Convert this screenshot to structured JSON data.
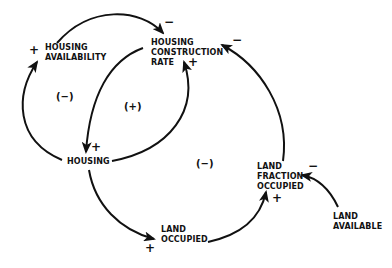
{
  "diagram": {
    "type": "causal-loop",
    "nodes": [
      {
        "id": "housing_availability",
        "label": "HOUSING\nAVAILABILITY"
      },
      {
        "id": "housing_construction_rate",
        "label": "HOUSING\nCONSTRUCTION\nRATE"
      },
      {
        "id": "housing",
        "label": "HOUSING"
      },
      {
        "id": "land_occupied",
        "label": "LAND\nOCCUPIED"
      },
      {
        "id": "land_fraction_occupied",
        "label": "LAND\nFRACTION\nOCCUPIED"
      },
      {
        "id": "land_available",
        "label": "LAND\nAVAILABLE"
      }
    ],
    "edges": [
      {
        "from": "housing_availability",
        "to": "housing_construction_rate",
        "sign": "−"
      },
      {
        "from": "housing",
        "to": "housing_construction_rate",
        "sign": "+"
      },
      {
        "from": "housing_construction_rate",
        "to": "housing",
        "sign": "+"
      },
      {
        "from": "housing",
        "to": "housing_availability",
        "sign": "+"
      },
      {
        "from": "housing",
        "to": "land_occupied",
        "sign": "+"
      },
      {
        "from": "land_occupied",
        "to": "land_fraction_occupied",
        "sign": "+"
      },
      {
        "from": "land_fraction_occupied",
        "to": "housing_construction_rate",
        "sign": "−"
      },
      {
        "from": "land_available",
        "to": "land_fraction_occupied",
        "sign": "−"
      }
    ],
    "loops": [
      {
        "label": "(−)"
      },
      {
        "label": "(+)"
      },
      {
        "label": "(−)"
      }
    ]
  }
}
